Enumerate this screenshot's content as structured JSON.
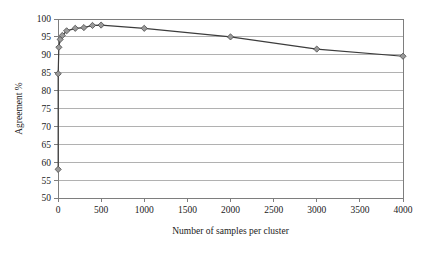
{
  "chart_data": {
    "type": "line",
    "title": "",
    "subtitle": "",
    "xlabel": "Number of samples per cluster",
    "ylabel": "Agreement %",
    "xlim": [
      0,
      4000
    ],
    "ylim": [
      50,
      100
    ],
    "xticks": [
      0,
      500,
      1000,
      1500,
      2000,
      2500,
      3000,
      3500,
      4000
    ],
    "xtick_labels": [
      "0",
      "500",
      "1000",
      "1500",
      "2000",
      "2500",
      "3000",
      "3500",
      "4000"
    ],
    "yticks": [
      50,
      55,
      60,
      65,
      70,
      75,
      80,
      85,
      90,
      95,
      100
    ],
    "ytick_labels": [
      "50",
      "55",
      "60",
      "65",
      "70",
      "75",
      "80",
      "85",
      "90",
      "95",
      "100"
    ],
    "grid": {
      "horizontal": true,
      "vertical": false
    },
    "legend": {
      "show": false,
      "position": "none"
    },
    "annotations": [],
    "series": [
      {
        "name": "Agreement",
        "marker": "diamond",
        "line_color": "#3c3c3c",
        "marker_fill": "#9a9a9a",
        "marker_edge": "#4a4a4a",
        "points": [
          {
            "x": 2,
            "y": 58.0
          },
          {
            "x": 2,
            "y": 84.7
          },
          {
            "x": 10,
            "y": 92.1
          },
          {
            "x": 25,
            "y": 94.3
          },
          {
            "x": 50,
            "y": 95.4
          },
          {
            "x": 100,
            "y": 96.7
          },
          {
            "x": 200,
            "y": 97.4
          },
          {
            "x": 300,
            "y": 97.6
          },
          {
            "x": 400,
            "y": 98.2
          },
          {
            "x": 500,
            "y": 98.3
          },
          {
            "x": 1000,
            "y": 97.4
          },
          {
            "x": 2000,
            "y": 95.0
          },
          {
            "x": 3000,
            "y": 91.6
          },
          {
            "x": 4000,
            "y": 89.6
          }
        ]
      }
    ]
  },
  "style": {
    "background": "#ffffff",
    "frame_color": "#7e7e7e",
    "grid_color": "#a8a8a8",
    "axis_text": "#1a1a1a"
  }
}
